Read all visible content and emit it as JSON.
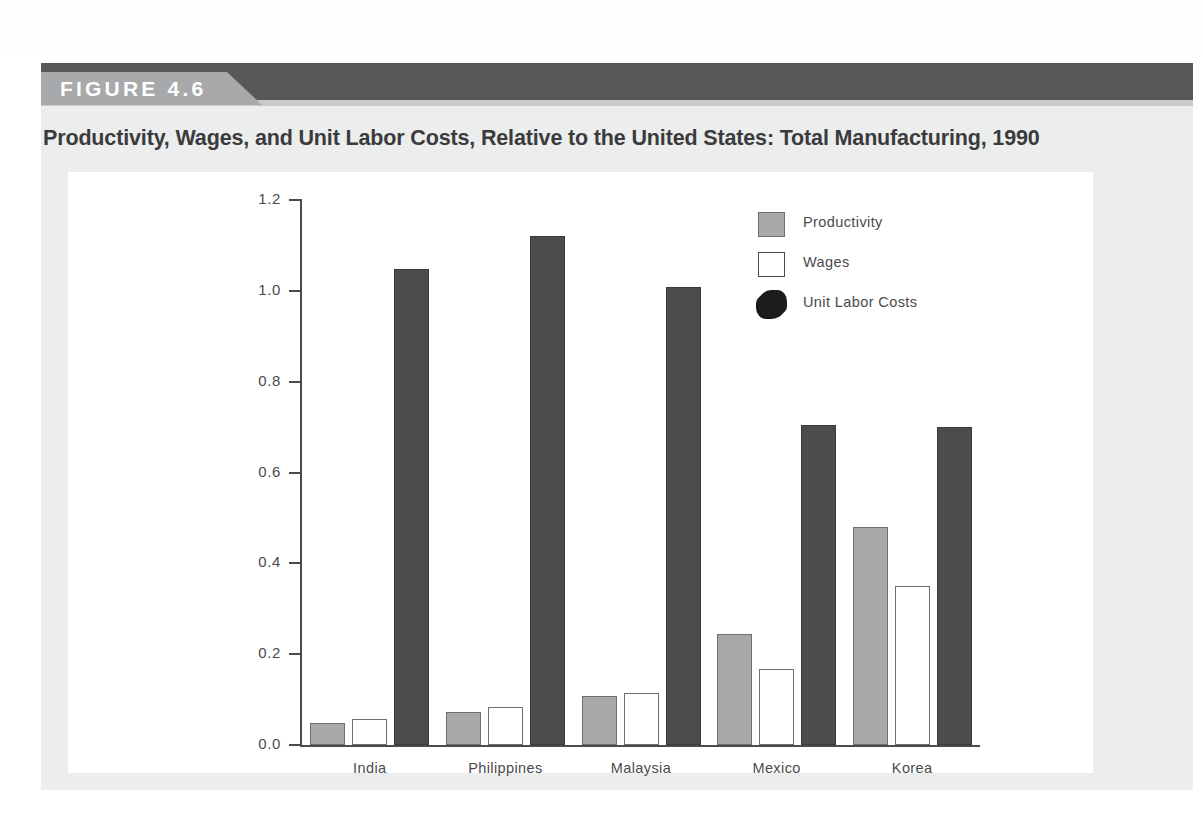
{
  "figure": {
    "badge_label": "FIGURE 4.6",
    "title": "Productivity, Wages, and Unit Labor Costs, Relative to the United States: Total Manufacturing, 1990"
  },
  "colors": {
    "banner_dark": "#58585a",
    "banner_tab": "#a7a9ab",
    "plate": "#eceded",
    "productivity": "#a8a9ab",
    "wages": "#ffffff",
    "unit_labor_costs": "#4c4c4e",
    "axis": "#4b4b4d",
    "text": "#4a4a4c"
  },
  "chart_data": {
    "type": "bar",
    "title": "Productivity, Wages, and Unit Labor Costs, Relative to the United States: Total Manufacturing, 1990",
    "xlabel": "",
    "ylabel": "",
    "ylim": [
      0.0,
      1.2
    ],
    "ytick_labels": [
      "1.2",
      "1.0",
      "0.8",
      "0.6",
      "0.4",
      "0.2",
      "0.0"
    ],
    "yticks": [
      1.2,
      1.0,
      0.8,
      0.6,
      0.4,
      0.2,
      0.0
    ],
    "grid": false,
    "legend_position": "upper-right-inside",
    "categories": [
      "India",
      "Philippines",
      "Malaysia",
      "Mexico",
      "Korea"
    ],
    "series": [
      {
        "name": "Productivity",
        "values": [
          0.048,
          0.072,
          0.108,
          0.245,
          0.48
        ]
      },
      {
        "name": "Wages",
        "values": [
          0.057,
          0.083,
          0.115,
          0.167,
          0.35
        ]
      },
      {
        "name": "Unit Labor Costs",
        "values": [
          1.048,
          1.12,
          1.008,
          0.705,
          0.7
        ]
      }
    ]
  }
}
